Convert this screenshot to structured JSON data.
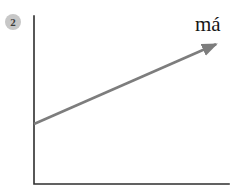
{
  "figure": {
    "badge_label": "2",
    "arrow_label": "má",
    "colors": {
      "background": "#ffffff",
      "axis": "#2e2e2e",
      "arrow": "#7d7d7d",
      "badge_bg": "#c7c7c7",
      "badge_text": "#3c3c3c",
      "label_text": "#161616"
    }
  }
}
